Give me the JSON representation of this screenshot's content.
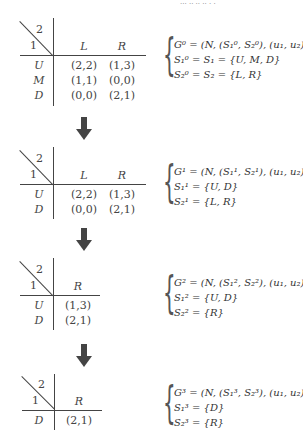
{
  "header_fragment": "··· ·· ·· ·· · ·",
  "arrow_icon": "down-arrow",
  "games": [
    {
      "player_col": "2",
      "player_row": "1",
      "columns": [
        "L",
        "R"
      ],
      "rows": [
        {
          "label": "U",
          "cells": [
            "(2,2)",
            "(1,3)"
          ]
        },
        {
          "label": "M",
          "cells": [
            "(1,1)",
            "(0,0)"
          ]
        },
        {
          "label": "D",
          "cells": [
            "(0,0)",
            "(2,1)"
          ]
        }
      ],
      "equations": [
        "G⁰ = (N, (S₁⁰, S₂⁰), (u₁, u₂))",
        "S₁⁰ = S₁ = {U, M, D}",
        "S₂⁰ = S₂ = {L, R}"
      ]
    },
    {
      "player_col": "2",
      "player_row": "1",
      "columns": [
        "L",
        "R"
      ],
      "rows": [
        {
          "label": "U",
          "cells": [
            "(2,2)",
            "(1,3)"
          ]
        },
        {
          "label": "D",
          "cells": [
            "(0,0)",
            "(2,1)"
          ]
        }
      ],
      "equations": [
        "G¹ = (N, (S₁¹, S₂¹), (u₁, u₂))",
        "S₁¹ = {U, D}",
        "S₂¹ = {L, R}"
      ]
    },
    {
      "player_col": "2",
      "player_row": "1",
      "columns": [
        "R"
      ],
      "rows": [
        {
          "label": "U",
          "cells": [
            "(1,3)"
          ]
        },
        {
          "label": "D",
          "cells": [
            "(2,1)"
          ]
        }
      ],
      "equations": [
        "G² = (N, (S₁², S₂²), (u₁, u₂))",
        "S₁² = {U, D}",
        "S₂² = {R}"
      ]
    },
    {
      "player_col": "2",
      "player_row": "1",
      "columns": [
        "R"
      ],
      "rows": [
        {
          "label": "D",
          "cells": [
            "(2,1)"
          ]
        }
      ],
      "equations": [
        "G³ = (N, (S₁³, S₂³), (u₁, u₂))",
        "S₁³ = {D}",
        "S₂³ = {R}"
      ]
    }
  ]
}
